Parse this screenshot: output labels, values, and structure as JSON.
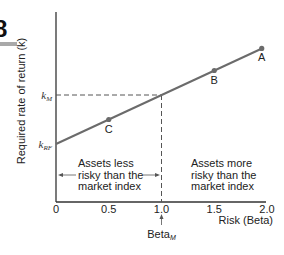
{
  "chart_data": {
    "type": "line",
    "title": "",
    "xlabel": "Risk (Beta)",
    "ylabel": "Required rate of return (k)",
    "xlim": [
      0,
      2.0
    ],
    "x_ticks": [
      "0",
      "0.5",
      "1.0",
      "1.5",
      "2.0"
    ],
    "x_tick_values": [
      0,
      0.5,
      1.0,
      1.5,
      2.0
    ],
    "y_tick_labels": [
      {
        "main": "k",
        "sub": "M",
        "beta_at": 1.0
      },
      {
        "main": "k",
        "sub": "RF",
        "beta_at": 0.0
      }
    ],
    "series": [
      {
        "name": "Security Market Line",
        "x": [
          0,
          2.0
        ],
        "y_relative": [
          0,
          2.0
        ]
      }
    ],
    "points": [
      {
        "label": "C",
        "beta": 0.5
      },
      {
        "label": "B",
        "beta": 1.5
      },
      {
        "label": "A",
        "beta": 1.95
      }
    ],
    "reference_beta": 1.0,
    "annotations": {
      "left_region": [
        "Assets less",
        "risky than the",
        "market index"
      ],
      "right_region": [
        "Assets more",
        "risky than the",
        "market index"
      ],
      "beta_marker": {
        "main": "Beta",
        "sub": "M"
      }
    },
    "grid": false,
    "legend": "none"
  },
  "figure_tag": "8",
  "colors": {
    "line": "#6b6b6b",
    "axis": "#333333",
    "dash": "#555555",
    "tag_bar": "#a9a9a9",
    "text": "#222222"
  }
}
